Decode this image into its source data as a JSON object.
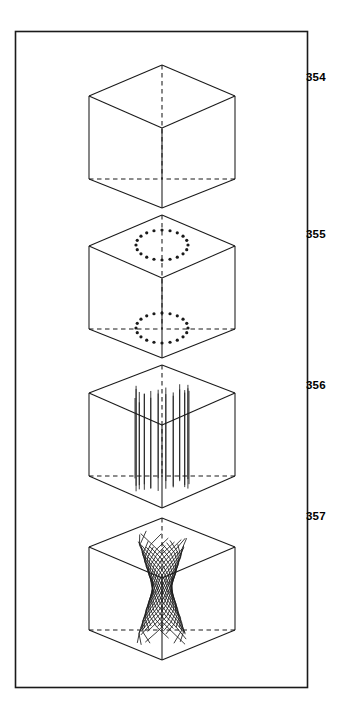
{
  "document": {
    "type": "patent-drawing-sheet",
    "background_color": "#ffffff",
    "ink_color": "#1a1a1a",
    "frame": {
      "name": "drawing-border",
      "x": 15,
      "y": 31,
      "width": 292,
      "height": 656,
      "stroke_width": 1.6
    }
  },
  "labels": [
    {
      "text": "354",
      "x": 306,
      "y": 72
    },
    {
      "text": "355",
      "x": 306,
      "y": 229
    },
    {
      "text": "356",
      "x": 306,
      "y": 380
    },
    {
      "text": "357",
      "x": 306,
      "y": 511
    }
  ],
  "figures": [
    {
      "id": "354",
      "name": "empty-cube",
      "caption": "354",
      "description": "Isometric wireframe cube, empty interior",
      "center_x": 162,
      "top_vertex_y": 65,
      "upper_corner_y": 96,
      "center_vertex_y": 128,
      "lower_corner_y": 179,
      "bottom_vertex_y": 208,
      "half_width": 73,
      "contents": "none"
    },
    {
      "id": "355",
      "name": "cube-with-dotted-circles",
      "caption": "355",
      "description": "Isometric wireframe cube containing two dotted elliptical rings, one on the top face and one on the bottom face",
      "center_x": 162,
      "top_vertex_y": 215,
      "upper_corner_y": 246,
      "center_vertex_y": 278,
      "lower_corner_y": 329,
      "bottom_vertex_y": 358,
      "half_width": 73,
      "contents": "dotted-rings",
      "rings": [
        {
          "name": "top-dotted-ring",
          "cy": 245,
          "rx": 26,
          "ry": 15,
          "dots": 20,
          "dot_radius": 1.6
        },
        {
          "name": "bottom-dotted-ring",
          "cy": 328,
          "rx": 26,
          "ry": 15,
          "dots": 20,
          "dot_radius": 1.6
        }
      ]
    },
    {
      "id": "356",
      "name": "cube-with-straight-fibers",
      "caption": "356",
      "description": "Isometric wireframe cube containing a vertical bundle of straight parallel fibers forming a cylinder",
      "center_x": 162,
      "top_vertex_y": 365,
      "upper_corner_y": 393,
      "center_vertex_y": 425,
      "lower_corner_y": 476,
      "bottom_vertex_y": 508,
      "half_width": 73,
      "contents": "straight-fiber-bundle",
      "fiber_count": 22,
      "fiber_bundle_top_y": 383,
      "fiber_bundle_bottom_y": 492,
      "fiber_bundle_rx": 27
    },
    {
      "id": "357",
      "name": "cube-with-twisted-fibers",
      "caption": "357",
      "description": "Isometric wireframe cube containing a twisted helical bundle of fibers pinched at the middle",
      "center_x": 162,
      "top_vertex_y": 518,
      "upper_corner_y": 547,
      "center_vertex_y": 578,
      "lower_corner_y": 630,
      "bottom_vertex_y": 660,
      "half_width": 73,
      "contents": "twisted-fiber-bundle",
      "fiber_count": 26,
      "fiber_bundle_top_y": 531,
      "fiber_bundle_bottom_y": 645,
      "fiber_bundle_rx": 27,
      "twist_turn": 0.42
    }
  ]
}
